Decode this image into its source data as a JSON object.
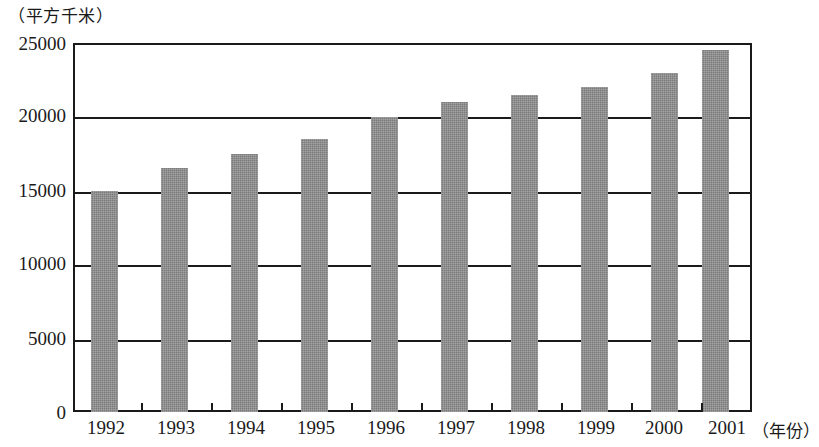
{
  "chart_data": {
    "type": "bar",
    "title": "",
    "subtitle": "",
    "xlabel": "（年份）",
    "ylabel": "（平方千米）",
    "categories": [
      "1992",
      "1993",
      "1994",
      "1995",
      "1996",
      "1997",
      "1998",
      "1999",
      "2000",
      "2001"
    ],
    "values": [
      15000,
      16500,
      17500,
      18500,
      20000,
      21000,
      21500,
      22000,
      23000,
      24500
    ],
    "ylim": [
      0,
      25000
    ],
    "y_ticks": [
      0,
      5000,
      10000,
      15000,
      20000,
      25000
    ],
    "y_tick_labels": [
      "0",
      "5000",
      "10000",
      "15000",
      "20000",
      "25000"
    ],
    "grid": true,
    "grid_axis": "y",
    "legend": false,
    "legend_position": "none",
    "series": [
      {
        "name": "面积",
        "color": "#7b7b7b",
        "values": [
          15000,
          16500,
          17500,
          18500,
          20000,
          21000,
          21500,
          22000,
          23000,
          24500
        ]
      }
    ]
  },
  "axes": {
    "y_unit_caption": "（平方千米）",
    "x_unit_caption": "（年份）",
    "y_labels": [
      "25000",
      "20000",
      "15000",
      "10000",
      "5000",
      "0"
    ],
    "x_labels": [
      "1992",
      "1993",
      "1994",
      "1995",
      "1996",
      "1997",
      "1998",
      "1999",
      "2000",
      "2001"
    ]
  },
  "colors": {
    "bar_fill": "#7b7b7b",
    "axis_line": "#1a1a1a",
    "background": "#ffffff"
  }
}
